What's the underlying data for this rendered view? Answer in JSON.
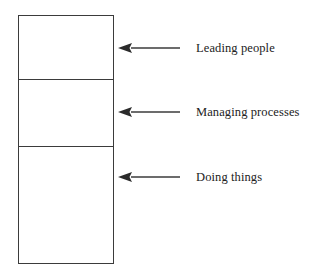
{
  "diagram": {
    "type": "stacked-block-with-callouts",
    "stack": {
      "segments": [
        {
          "id": "top",
          "label_ref": "Leading people"
        },
        {
          "id": "middle",
          "label_ref": "Managing processes"
        },
        {
          "id": "bottom",
          "label_ref": "Doing things"
        }
      ]
    },
    "callouts": [
      {
        "arrow": "left-arrow",
        "label": "Leading people"
      },
      {
        "arrow": "left-arrow",
        "label": "Managing processes"
      },
      {
        "arrow": "left-arrow",
        "label": "Doing things"
      }
    ],
    "colors": {
      "line": "#3b3b3b",
      "text": "#222222",
      "background": "#ffffff"
    }
  }
}
